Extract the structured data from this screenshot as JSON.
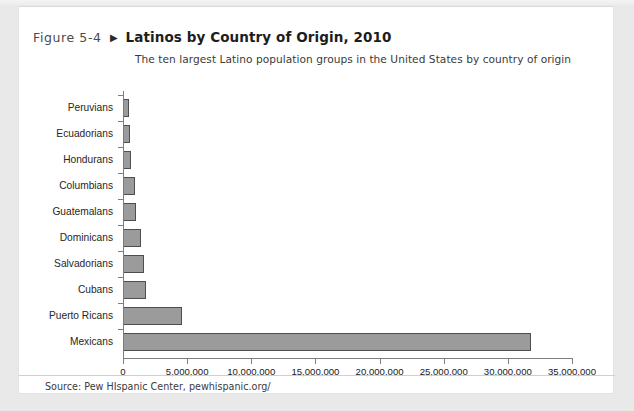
{
  "figure": {
    "label": "Figure 5-4",
    "arrow_icon": "triangle-right-icon",
    "title": "Latinos by Country of Origin, 2010",
    "subtitle": "The ten largest Latino population groups in the United States by country of origin",
    "source": "Source: Pew HIspanic Center, pewhispanic.org/"
  },
  "colors": {
    "bar_fill": "#9b9b9b",
    "bar_border": "#4e4e4e",
    "axis": "#7d7d7d",
    "page_background": "#ffffff",
    "outer_background": "#e9e9e9"
  },
  "chart_data": {
    "type": "bar",
    "orientation": "horizontal",
    "title": "Latinos by Country of Origin, 2010",
    "subtitle": "The ten largest Latino population groups in the United States by country of origin",
    "xlabel": "",
    "ylabel": "",
    "categories": [
      "Peruvians",
      "Ecuadorians",
      "Hondurans",
      "Columbians",
      "Guatemalans",
      "Dominicans",
      "Salvadorians",
      "Cubans",
      "Puerto Ricans",
      "Mexicans"
    ],
    "values": [
      500000,
      560000,
      630000,
      900000,
      1040000,
      1410000,
      1650000,
      1790000,
      4620000,
      31800000
    ],
    "xlim": [
      0,
      35000000
    ],
    "xticks": [
      0,
      5000000,
      10000000,
      15000000,
      20000000,
      25000000,
      30000000,
      35000000
    ],
    "xtick_labels": [
      "0",
      "5,000,000",
      "10,000,000",
      "15,000,000",
      "20,000,000",
      "25,000,000",
      "30,000,000",
      "35,000,000"
    ],
    "grid": false,
    "legend": null
  }
}
